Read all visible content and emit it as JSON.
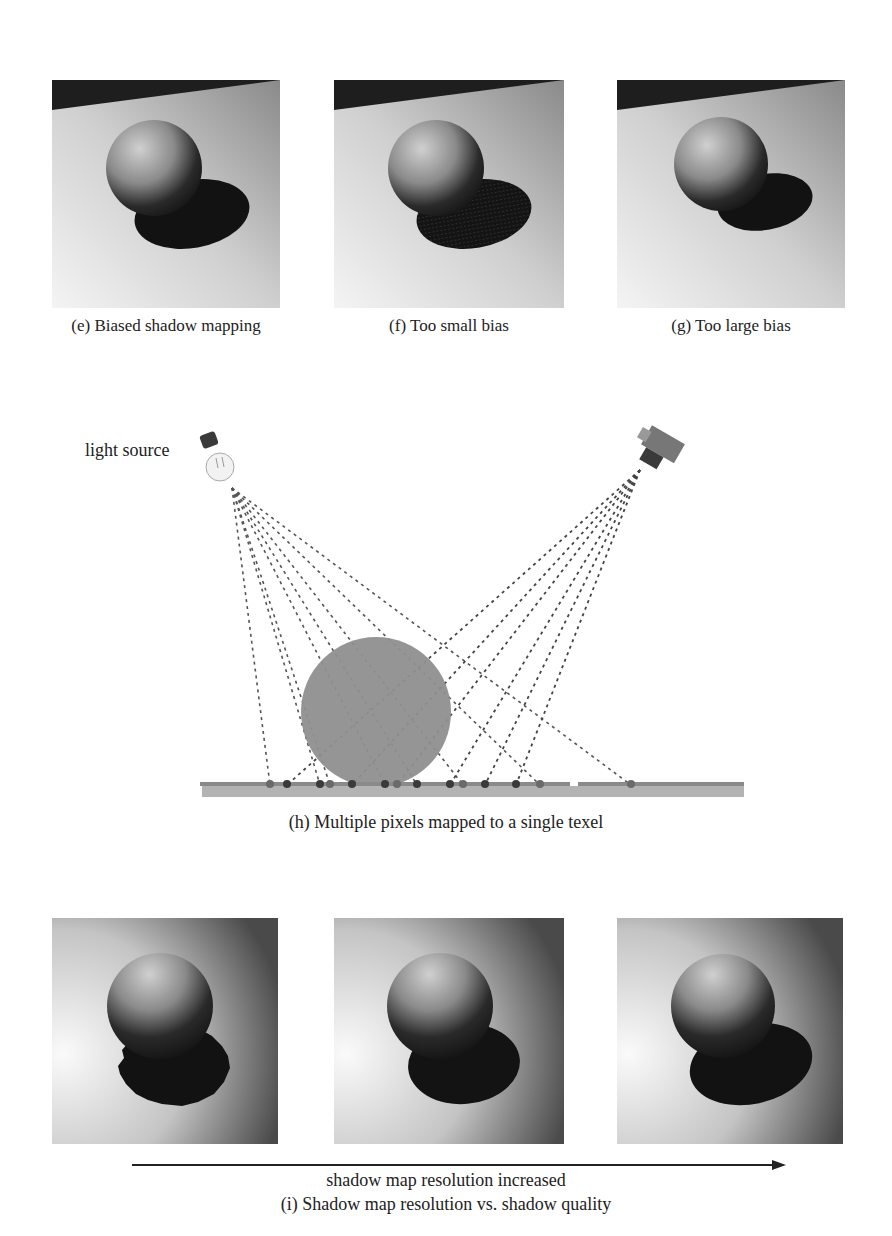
{
  "top_row": {
    "panels": [
      {
        "id": "e",
        "caption": "(e) Biased shadow mapping",
        "shadow_style": "clean",
        "x": 52,
        "y": 80,
        "w": 228,
        "h": 228
      },
      {
        "id": "f",
        "caption": "(f) Too small bias",
        "shadow_style": "acne",
        "x": 334,
        "y": 80,
        "w": 230,
        "h": 228
      },
      {
        "id": "g",
        "caption": "(g) Too large bias",
        "shadow_style": "peter-panning",
        "x": 617,
        "y": 80,
        "w": 228,
        "h": 228
      }
    ]
  },
  "diagram_h": {
    "light_label": "light source",
    "light_icon": "light-bulb-icon",
    "camera_icon": "camera-icon",
    "caption": "(h) Multiple pixels mapped to a single texel",
    "light_origin": [
      232,
      488
    ],
    "camera_origin": [
      640,
      470
    ],
    "sphere": {
      "cx": 376,
      "cy": 712,
      "r": 75,
      "color": "#8f8f8f"
    },
    "floor": {
      "x1": 200,
      "x2": 744,
      "y": 785,
      "color": "#9e9e9e"
    },
    "light_ray_targets": [
      270,
      320,
      330,
      385,
      417,
      463,
      540,
      631
    ],
    "camera_ray_targets": [
      287,
      352,
      397,
      450,
      485,
      516
    ],
    "sample_dots": [
      {
        "x": 270,
        "type": "light"
      },
      {
        "x": 287,
        "type": "camera"
      },
      {
        "x": 320,
        "type": "camera"
      },
      {
        "x": 330,
        "type": "light"
      },
      {
        "x": 352,
        "type": "camera"
      },
      {
        "x": 385,
        "type": "camera"
      },
      {
        "x": 397,
        "type": "light"
      },
      {
        "x": 417,
        "type": "camera"
      },
      {
        "x": 450,
        "type": "camera"
      },
      {
        "x": 463,
        "type": "light"
      },
      {
        "x": 485,
        "type": "camera"
      },
      {
        "x": 516,
        "type": "camera"
      },
      {
        "x": 540,
        "type": "light"
      },
      {
        "x": 631,
        "type": "light"
      }
    ],
    "colors": {
      "ray": "#555555",
      "dot_dark": "#3a3a3a",
      "dot_light": "#6a6a6a"
    }
  },
  "bottom_row": {
    "panels": [
      {
        "id": "i1",
        "resolution": "low",
        "x": 52,
        "y": 918,
        "w": 226,
        "h": 226
      },
      {
        "id": "i2",
        "resolution": "medium",
        "x": 334,
        "y": 918,
        "w": 230,
        "h": 226
      },
      {
        "id": "i3",
        "resolution": "high",
        "x": 617,
        "y": 918,
        "w": 226,
        "h": 226
      }
    ],
    "arrow_label": "shadow map resolution increased",
    "caption": "(i) Shadow map resolution vs. shadow quality",
    "arrow": {
      "x1": 132,
      "x2": 786,
      "y": 1165
    }
  }
}
